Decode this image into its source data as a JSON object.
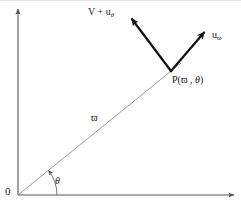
{
  "figure": {
    "background_color": "#ffffff",
    "width": 241,
    "height": 208
  },
  "axes": {
    "color": "#555555",
    "x_axis": {
      "name": "x-axis",
      "from": [
        18,
        195
      ],
      "to": [
        238,
        195
      ],
      "arrow": true
    },
    "y_axis": {
      "name": "y-axis",
      "from": [
        18,
        195
      ],
      "to": [
        18,
        6
      ],
      "arrow": true
    },
    "origin_label": "0"
  },
  "radius": {
    "color": "#8a8a8a",
    "from": [
      18,
      195
    ],
    "to": [
      180,
      64
    ],
    "label": "ϖ",
    "label_name": "varpi"
  },
  "angle": {
    "arc_color": "#555555",
    "label": "θ",
    "label_name": "theta",
    "radius_px": 38
  },
  "point": {
    "label_prefix": "P(",
    "label_r": "ϖ",
    "label_sep": " , ",
    "label_theta": "θ",
    "label_suffix": ")",
    "position": [
      171,
      71
    ]
  },
  "vectors": [
    {
      "name": "v-plus-u-theta",
      "label_main": "V + u",
      "label_sub": "θ",
      "color": "#111111",
      "from": [
        171,
        71
      ],
      "to": [
        128,
        14
      ]
    },
    {
      "name": "u-varpi",
      "label_main": "u",
      "label_sub": "ϖ",
      "color": "#111111",
      "from": [
        171,
        71
      ],
      "to": [
        208,
        28
      ]
    }
  ]
}
